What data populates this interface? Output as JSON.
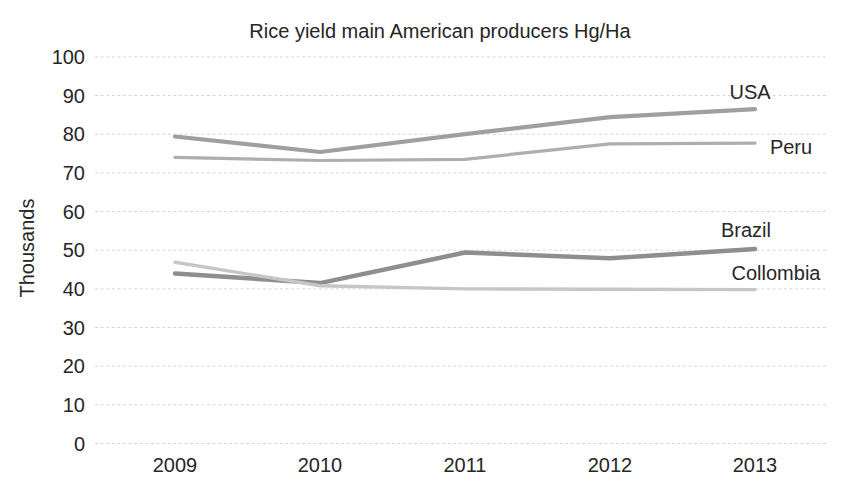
{
  "chart_data": {
    "type": "line",
    "title": "Rice yield main American producers Hg/Ha",
    "ylabel": "Thousands",
    "xlabel": "",
    "categories": [
      "2009",
      "2010",
      "2011",
      "2012",
      "2013"
    ],
    "ylim": [
      0,
      100
    ],
    "yticks": [
      100,
      90,
      80,
      70,
      60,
      50,
      40,
      30,
      20,
      10,
      0
    ],
    "grid": "horizontal dotted gridlines only, no axis lines, no markers",
    "legend_position": "labels at right end of each line",
    "units": "thousands of Hg/Ha",
    "gridline_color": "#d6d6d6",
    "text_color": "#262626",
    "background_color": "#ffffff",
    "series": [
      {
        "name": "USA",
        "color": "#9f9f9f",
        "values": [
          79.4,
          75.4,
          80.0,
          84.4,
          86.5
        ]
      },
      {
        "name": "Peru",
        "color": "#aeaeae",
        "values": [
          74.0,
          73.2,
          73.5,
          77.5,
          77.7
        ]
      },
      {
        "name": "Brazil",
        "color": "#8e8e8e",
        "values": [
          44.0,
          41.5,
          49.4,
          47.9,
          50.3
        ]
      },
      {
        "name": "Collombia",
        "color": "#c6c6c6",
        "values": [
          46.9,
          40.8,
          40.0,
          39.9,
          39.8
        ]
      }
    ]
  }
}
